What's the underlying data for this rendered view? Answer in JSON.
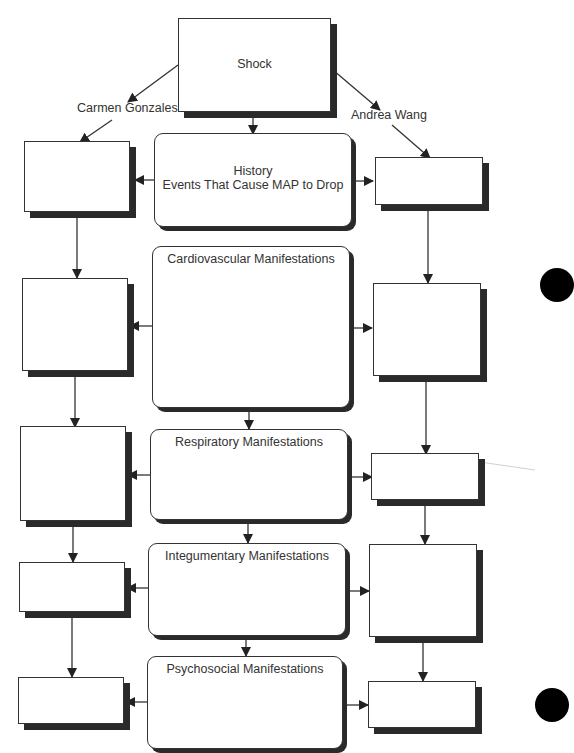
{
  "diagram": {
    "root": {
      "label": "Shock"
    },
    "branch_labels": {
      "left": "Carmen Gonzales",
      "right": "Andrea Wang"
    },
    "center_nodes": [
      {
        "id": "history",
        "line1": "History",
        "line2": "Events That Cause MAP to Drop"
      },
      {
        "id": "cardiovascular",
        "label": "Cardiovascular Manifestations"
      },
      {
        "id": "respiratory",
        "label": "Respiratory Manifestations"
      },
      {
        "id": "integumentary",
        "label": "Integumentary Manifestations"
      },
      {
        "id": "psychosocial",
        "label": "Psychosocial Manifestations"
      }
    ],
    "left_boxes": [
      "",
      "",
      "",
      "",
      ""
    ],
    "right_boxes": [
      "",
      "",
      "",
      "",
      ""
    ],
    "colors": {
      "line": "#333333",
      "shadow": "#2a2a2a",
      "hole_punch": "#000000"
    }
  }
}
